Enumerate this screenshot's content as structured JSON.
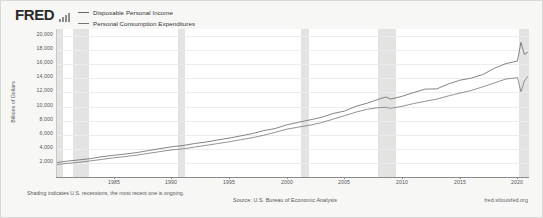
{
  "branding": {
    "logo_text": "FRED",
    "logo_mark_icon": "bar-chart-icon"
  },
  "legend": {
    "entries": [
      {
        "label": "Disposable Personal Income",
        "color": "#666666"
      },
      {
        "label": "Personal Consumption Expenditures",
        "color": "#777777"
      }
    ]
  },
  "footer": {
    "shading_note": "Shading indicates U.S. recessions, the most recent one is ongoing.",
    "source": "Source: U.S. Bureau of Economic Analysis",
    "url": "fred.stlouisfed.org"
  },
  "chart_data": {
    "type": "line",
    "title": "",
    "xlabel": "",
    "ylabel": "Billions of Dollars",
    "xlim": [
      1980,
      2021
    ],
    "ylim": [
      0,
      21000
    ],
    "grid": true,
    "legend_position": "top-left",
    "xticks": [
      1985,
      1990,
      1995,
      2000,
      2005,
      2010,
      2015,
      2020
    ],
    "yticks": [
      2000,
      4000,
      6000,
      8000,
      10000,
      12000,
      14000,
      16000,
      18000,
      20000
    ],
    "ytick_labels": [
      "2,000",
      "4,000",
      "6,000",
      "8,000",
      "10,000",
      "12,000",
      "14,000",
      "16,000",
      "18,000",
      "20,000"
    ],
    "recessions": [
      {
        "start": 1980.0,
        "end": 1980.6
      },
      {
        "start": 1981.5,
        "end": 1982.9
      },
      {
        "start": 1990.6,
        "end": 1991.2
      },
      {
        "start": 2001.2,
        "end": 2001.9
      },
      {
        "start": 2007.9,
        "end": 2009.5
      },
      {
        "start": 2020.1,
        "end": 2021.0
      }
    ],
    "x": [
      1980,
      1981,
      1982,
      1983,
      1984,
      1985,
      1986,
      1987,
      1988,
      1989,
      1990,
      1991,
      1992,
      1993,
      1994,
      1995,
      1996,
      1997,
      1998,
      1999,
      2000,
      2001,
      2002,
      2003,
      2004,
      2005,
      2006,
      2007,
      2008,
      2008.6,
      2009,
      2010,
      2011,
      2012,
      2013,
      2014,
      2015,
      2016,
      2017,
      2018,
      2019,
      2020.0,
      2020.3,
      2020.6,
      2020.9
    ],
    "series": [
      {
        "name": "Disposable Personal Income",
        "color": "#666666",
        "values": [
          2030,
          2260,
          2430,
          2610,
          2890,
          3080,
          3260,
          3460,
          3750,
          4020,
          4290,
          4460,
          4750,
          4960,
          5250,
          5520,
          5830,
          6150,
          6580,
          6880,
          7400,
          7750,
          8100,
          8460,
          9000,
          9350,
          10030,
          10490,
          11050,
          11350,
          11050,
          11450,
          11980,
          12470,
          12500,
          13190,
          13730,
          14030,
          14540,
          15430,
          16090,
          16450,
          19100,
          17400,
          17700
        ]
      },
      {
        "name": "Personal Consumption Expenditures",
        "color": "#777777",
        "values": [
          1760,
          1940,
          2080,
          2290,
          2500,
          2720,
          2900,
          3100,
          3350,
          3600,
          3840,
          3990,
          4240,
          4490,
          4740,
          4990,
          5290,
          5570,
          5920,
          6340,
          6790,
          7070,
          7350,
          7710,
          8200,
          8700,
          9200,
          9620,
          9840,
          9900,
          9750,
          10030,
          10420,
          10740,
          11050,
          11500,
          11900,
          12280,
          12800,
          13350,
          13900,
          14100,
          12100,
          13600,
          14300
        ]
      }
    ]
  }
}
